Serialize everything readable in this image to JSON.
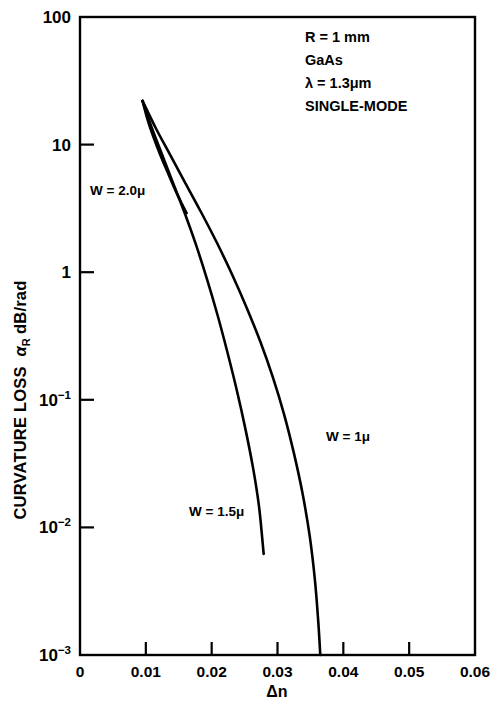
{
  "chart_data": {
    "type": "line",
    "title": "",
    "xlabel": "Δn",
    "ylabel": "CURVATURE LOSS αR dB/rad",
    "ylabel_main": "CURVATURE LOSS",
    "ylabel_symbol": "α",
    "ylabel_subscript": "R",
    "ylabel_units": "dB/rad",
    "xlim": [
      0,
      0.06
    ],
    "ylim": [
      0.001,
      100
    ],
    "yscale": "log",
    "xscale": "linear",
    "grid": false,
    "legend": "inline-curve-labels",
    "xticks": [
      "0",
      "0.01",
      "0.02",
      "0.03",
      "0.04",
      "0.05",
      "0.06"
    ],
    "xtick_values": [
      0,
      0.01,
      0.02,
      0.03,
      0.04,
      0.05,
      0.06
    ],
    "yticks": [
      {
        "label": "100",
        "base": "100",
        "exp": "",
        "value": 100
      },
      {
        "label": "10",
        "base": "10",
        "exp": "",
        "value": 10
      },
      {
        "label": "1",
        "base": "1",
        "exp": "",
        "value": 1
      },
      {
        "label": "10-1",
        "base": "10",
        "exp": "−1",
        "value": 0.1
      },
      {
        "label": "10-2",
        "base": "10",
        "exp": "−2",
        "value": 0.01
      },
      {
        "label": "10-3",
        "base": "10",
        "exp": "−3",
        "value": 0.001
      }
    ],
    "annotations": [
      "R = 1 mm",
      "GaAs",
      "λ = 1.3μm",
      "SINGLE-MODE"
    ],
    "series": [
      {
        "name": "W = 2.0μ",
        "label": "W = 2.0μ",
        "color": "#000000",
        "points": [
          [
            0.0095,
            22.0
          ],
          [
            0.0103,
            15.5
          ],
          [
            0.0112,
            11.3
          ],
          [
            0.0122,
            8.3
          ],
          [
            0.0133,
            6.1
          ],
          [
            0.0144,
            4.5
          ],
          [
            0.0154,
            3.5
          ],
          [
            0.0162,
            2.9
          ]
        ]
      },
      {
        "name": "W = 1.5μ",
        "label": "W = 1.5μ",
        "color": "#000000",
        "points": [
          [
            0.0095,
            22.0
          ],
          [
            0.0108,
            14.0
          ],
          [
            0.0123,
            8.8
          ],
          [
            0.014,
            5.2
          ],
          [
            0.0158,
            3.0
          ],
          [
            0.0176,
            1.65
          ],
          [
            0.0193,
            0.88
          ],
          [
            0.0209,
            0.46
          ],
          [
            0.0224,
            0.235
          ],
          [
            0.0238,
            0.12
          ],
          [
            0.0251,
            0.06
          ],
          [
            0.0263,
            0.029
          ],
          [
            0.0272,
            0.0145
          ],
          [
            0.0279,
            0.0062
          ]
        ]
      },
      {
        "name": "W = 1μ",
        "label": "W = 1μ",
        "color": "#000000",
        "points": [
          [
            0.0095,
            22.0
          ],
          [
            0.0115,
            13.5
          ],
          [
            0.0137,
            8.3
          ],
          [
            0.016,
            5.0
          ],
          [
            0.0184,
            2.95
          ],
          [
            0.0208,
            1.7
          ],
          [
            0.0231,
            0.96
          ],
          [
            0.0253,
            0.53
          ],
          [
            0.0274,
            0.285
          ],
          [
            0.0293,
            0.15
          ],
          [
            0.031,
            0.077
          ],
          [
            0.0325,
            0.038
          ],
          [
            0.0338,
            0.0185
          ],
          [
            0.0349,
            0.0085
          ],
          [
            0.0357,
            0.0038
          ],
          [
            0.0362,
            0.0018
          ],
          [
            0.0365,
            0.001
          ]
        ]
      }
    ],
    "curve_label_positions": [
      {
        "label": "W = 2.0μ",
        "x_px": 90,
        "y_px": 195
      },
      {
        "label": "W = 1μ",
        "x_px": 326,
        "y_px": 441
      },
      {
        "label": "W = 1.5μ",
        "x_px": 189,
        "y_px": 516
      }
    ]
  }
}
